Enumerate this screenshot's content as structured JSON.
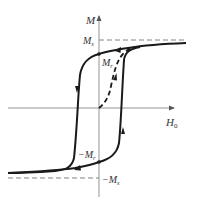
{
  "figure": {
    "axes": {
      "y_label": "M",
      "x_label": "H",
      "x_label_subscript": "0"
    },
    "annotations": {
      "saturation_pos": {
        "base": "M",
        "sub": "s"
      },
      "remanence_pos": {
        "base": "M",
        "sub": "r"
      },
      "remanence_neg": {
        "base": "−M",
        "sub": "r"
      },
      "saturation_neg": {
        "base": "−M",
        "sub": "s"
      }
    },
    "curves": [
      {
        "name": "upper-branch",
        "style": "solid",
        "direction": "decreasing-H"
      },
      {
        "name": "lower-branch",
        "style": "solid",
        "direction": "increasing-H"
      },
      {
        "name": "initial-magnetization",
        "style": "dashed",
        "direction": "from-origin"
      }
    ],
    "colors": {
      "curve": "#1a1a1a",
      "axis": "#888888",
      "dashed_guide": "#777777",
      "label": "#333333"
    }
  }
}
